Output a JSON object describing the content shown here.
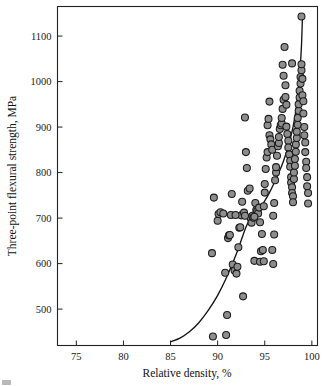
{
  "chart_data": {
    "type": "scatter",
    "title": "",
    "xlabel": "Relative density, %",
    "ylabel": "Three-point flexural strength, MPa",
    "xlim": [
      73,
      100.6
    ],
    "ylim": [
      420,
      1165
    ],
    "xticks": [
      75,
      80,
      85,
      90,
      95,
      100
    ],
    "xtick_labels": [
      "75",
      "80",
      "85",
      "90",
      "95",
      "100"
    ],
    "yticks": [
      500,
      600,
      700,
      800,
      900,
      1000,
      1100
    ],
    "ytick_labels": [
      "500",
      "600",
      "700",
      "800",
      "900",
      "1000",
      "1100"
    ],
    "grid": false,
    "legend": false,
    "marker": {
      "shape": "circle",
      "fill": "#8d8d8d",
      "edge": "#1b1b1b",
      "size_px": 7
    },
    "series": [
      {
        "name": "Specimens",
        "x": [
          89.6,
          89.4,
          89.5,
          90.0,
          90.1,
          90.3,
          90.6,
          90.8,
          90.9,
          91.0,
          91.1,
          91.2,
          91.3,
          91.4,
          91.5,
          91.6,
          91.8,
          92.0,
          92.1,
          92.2,
          92.3,
          92.4,
          92.5,
          92.6,
          92.7,
          92.8,
          92.9,
          93.0,
          93.1,
          93.2,
          93.4,
          93.5,
          93.6,
          93.7,
          93.8,
          93.9,
          94.0,
          94.1,
          94.2,
          94.3,
          94.4,
          94.5,
          94.5,
          94.6,
          94.7,
          94.8,
          94.9,
          95.0,
          95.0,
          95.1,
          95.2,
          95.3,
          95.3,
          95.4,
          95.5,
          95.5,
          95.6,
          95.7,
          95.8,
          95.8,
          95.9,
          96.0,
          96.0,
          96.1,
          96.2,
          96.2,
          96.3,
          96.4,
          96.5,
          96.5,
          96.6,
          96.7,
          96.8,
          96.8,
          96.9,
          97.0,
          97.0,
          97.1,
          97.2,
          97.2,
          97.3,
          97.3,
          97.4,
          97.5,
          97.5,
          97.6,
          97.7,
          97.7,
          97.8,
          97.8,
          97.9,
          97.9,
          98.0,
          98.0,
          98.1,
          98.1,
          98.2,
          98.2,
          98.3,
          98.3,
          98.4,
          98.4,
          98.5,
          98.5,
          98.6,
          98.6,
          98.7,
          98.7,
          98.8,
          98.8,
          98.9,
          98.9,
          99.0,
          99.0,
          99.1,
          99.1,
          99.2,
          99.2,
          99.3,
          99.3,
          99.4,
          99.4,
          99.5,
          99.5,
          99.6,
          99.6,
          98.9,
          97.9,
          96.9,
          95.9,
          94.9,
          93.9,
          92.9,
          91.9
        ],
        "y": [
          745,
          623,
          440,
          694,
          709,
          713,
          710,
          580,
          443,
          487,
          656,
          662,
          663,
          707,
          753,
          598,
          585,
          578,
          593,
          636,
          679,
          680,
          706,
          736,
          528,
          712,
          921,
          845,
          810,
          760,
          765,
          700,
          690,
          705,
          701,
          606,
          733,
          718,
          715,
          710,
          723,
          691,
          604,
          627,
          665,
          630,
          726,
          756,
          775,
          808,
          833,
          845,
          904,
          918,
          956,
          882,
          873,
          862,
          850,
          630,
          705,
          664,
          733,
          783,
          800,
          812,
          837,
          858,
          865,
          878,
          896,
          904,
          908,
          920,
          940,
          960,
          1013,
          1076,
          992,
          966,
          949,
          901,
          885,
          870,
          855,
          840,
          826,
          813,
          790,
          778,
          768,
          755,
          748,
          735,
          786,
          800,
          815,
          830,
          846,
          862,
          876,
          890,
          905,
          920,
          936,
          950,
          965,
          980,
          996,
          1010,
          1025,
          1038,
          1006,
          970,
          957,
          930,
          900,
          882,
          866,
          845,
          824,
          810,
          790,
          770,
          755,
          732,
          1143,
          1040,
          1037,
          599,
          605,
          703,
          705,
          707
        ],
        "count": 134
      }
    ],
    "trend": {
      "type": "fitted-curve",
      "description": "exponential rise of flexural strength with relative density",
      "points": [
        [
          85.0,
          428
        ],
        [
          86.0,
          436
        ],
        [
          87.0,
          450
        ],
        [
          88.0,
          470
        ],
        [
          89.0,
          497
        ],
        [
          90.0,
          530
        ],
        [
          91.0,
          572
        ],
        [
          92.0,
          622
        ],
        [
          93.0,
          680
        ],
        [
          93.6,
          704
        ],
        [
          94.0,
          712
        ],
        [
          94.5,
          722
        ],
        [
          95.0,
          738
        ],
        [
          95.5,
          756
        ],
        [
          96.0,
          777
        ],
        [
          96.5,
          800
        ],
        [
          97.0,
          826
        ],
        [
          97.5,
          858
        ],
        [
          98.0,
          900
        ],
        [
          98.4,
          950
        ],
        [
          98.7,
          1010
        ],
        [
          98.9,
          1080
        ],
        [
          99.0,
          1140
        ]
      ]
    }
  },
  "axes": {
    "frame_color": "#222222",
    "background": "#ffffff"
  }
}
